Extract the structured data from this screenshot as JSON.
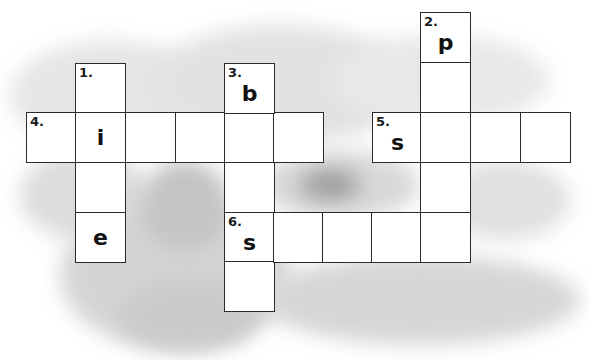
{
  "puzzle": {
    "type": "crossword",
    "cell_size": 50,
    "clues": [
      {
        "number": "1.",
        "direction": "down",
        "length": 4,
        "given": {
          "1": "i",
          "3": "e"
        }
      },
      {
        "number": "2.",
        "direction": "down",
        "length": 5,
        "given": {
          "0": "p"
        }
      },
      {
        "number": "3.",
        "direction": "down",
        "length": 5,
        "given": {
          "0": "b"
        }
      },
      {
        "number": "4.",
        "direction": "across",
        "length": 6,
        "given": {
          "1": "i"
        }
      },
      {
        "number": "5.",
        "direction": "across",
        "length": 4,
        "given": {
          "0": "s"
        }
      },
      {
        "number": "6.",
        "direction": "across",
        "length": 5,
        "given": {
          "0": "s"
        }
      }
    ],
    "cells": [
      {
        "x": 75,
        "y": 63,
        "num": "1.",
        "letter": ""
      },
      {
        "x": 26,
        "y": 112,
        "num": "4.",
        "letter": ""
      },
      {
        "x": 75,
        "y": 112,
        "num": "",
        "letter": "i"
      },
      {
        "x": 125,
        "y": 112,
        "num": "",
        "letter": ""
      },
      {
        "x": 175,
        "y": 112,
        "num": "",
        "letter": ""
      },
      {
        "x": 224,
        "y": 112,
        "num": "",
        "letter": ""
      },
      {
        "x": 273,
        "y": 112,
        "num": "",
        "letter": ""
      },
      {
        "x": 75,
        "y": 162,
        "num": "",
        "letter": ""
      },
      {
        "x": 75,
        "y": 212,
        "num": "",
        "letter": "e"
      },
      {
        "x": 224,
        "y": 63,
        "num": "3.",
        "letter": "b"
      },
      {
        "x": 224,
        "y": 162,
        "num": "",
        "letter": ""
      },
      {
        "x": 224,
        "y": 212,
        "num": "6.",
        "letter": "s"
      },
      {
        "x": 224,
        "y": 261,
        "num": "",
        "letter": ""
      },
      {
        "x": 273,
        "y": 212,
        "num": "",
        "letter": ""
      },
      {
        "x": 322,
        "y": 212,
        "num": "",
        "letter": ""
      },
      {
        "x": 371,
        "y": 212,
        "num": "",
        "letter": ""
      },
      {
        "x": 420,
        "y": 212,
        "num": "",
        "letter": ""
      },
      {
        "x": 420,
        "y": 12,
        "num": "2.",
        "letter": "p"
      },
      {
        "x": 420,
        "y": 62,
        "num": "",
        "letter": ""
      },
      {
        "x": 372,
        "y": 112,
        "num": "5.",
        "letter": "s"
      },
      {
        "x": 420,
        "y": 112,
        "num": "",
        "letter": ""
      },
      {
        "x": 470,
        "y": 112,
        "num": "",
        "letter": ""
      },
      {
        "x": 520,
        "y": 112,
        "num": "",
        "letter": ""
      },
      {
        "x": 420,
        "y": 162,
        "num": "",
        "letter": ""
      }
    ]
  },
  "colors": {
    "background": "#ffffff",
    "cloud_light": "#e4e4e4",
    "cloud_mid": "#cfcfcf",
    "cloud_dark": "#a9a9a9",
    "grid_line": "#2a2a2a"
  }
}
